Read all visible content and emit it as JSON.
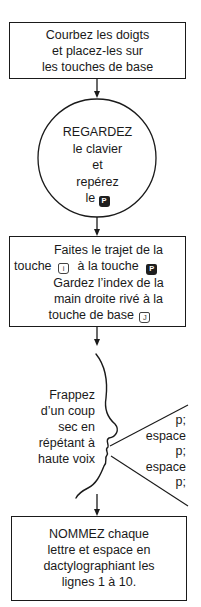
{
  "diagram": {
    "type": "flowchart",
    "title_cut_off": "",
    "steps": [
      {
        "id": "step1",
        "shape": "rectangle",
        "lines": [
          "Courbez les doigts",
          "et placez-les sur",
          "les touches de base"
        ]
      },
      {
        "id": "step2",
        "shape": "circle",
        "lines": [
          "REGARDEZ",
          "le clavier",
          "et",
          "repérez",
          "le"
        ],
        "key": {
          "label": "P",
          "style": "dark"
        }
      },
      {
        "id": "step3",
        "shape": "rectangle",
        "line1": "Faites le trajet de la",
        "line2_prefix": "touche",
        "line2_key1": {
          "label": "i",
          "style": "light"
        },
        "line2_middle": "à la touche",
        "line2_key2": {
          "label": "P",
          "style": "dark"
        },
        "line3": "Gardez l’index de la",
        "line4": "main droite rivé à la",
        "line5_prefix": "touche de base",
        "line5_key": {
          "label": "J",
          "style": "light"
        }
      },
      {
        "id": "step4",
        "shape": "speaking-profile",
        "left_lines": [
          "Frappez",
          "d’un coup",
          "sec en",
          "répétant à",
          "haute voix"
        ],
        "spoken_lines": [
          "p;",
          "espace",
          "p;",
          "espace",
          "p;"
        ]
      },
      {
        "id": "step5",
        "shape": "rectangle",
        "lines": [
          "NOMMEZ chaque",
          "lettre et espace en",
          "dactylographiant les",
          "lignes 1 à 10."
        ]
      }
    ],
    "colors": {
      "stroke": "#1a1a1a",
      "background": "#ffffff",
      "key_dark": "#1e1e1e"
    }
  }
}
